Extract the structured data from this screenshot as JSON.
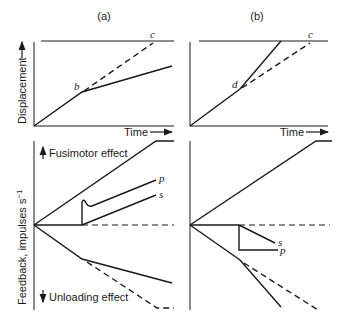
{
  "panels": [
    {
      "id": "a",
      "label": "(a)"
    },
    {
      "id": "b",
      "label": "(b)"
    }
  ],
  "axes": {
    "top_ylabel": "Displacement",
    "bottom_ylabel": "Feedback, impulses s",
    "bottom_ylabel_sup": "−1",
    "xlabel": "Time",
    "fusimotor_label": "Fusimotor effect",
    "unloading_label": "Unloading effect"
  },
  "points": {
    "b": "b",
    "c_a": "c",
    "d": "d",
    "c_b": "c",
    "p_a": "p",
    "s_a": "s",
    "s_b": "s",
    "p_b": "p"
  },
  "colors": {
    "ink": "#1a1a1a",
    "background": "#ffffff"
  }
}
